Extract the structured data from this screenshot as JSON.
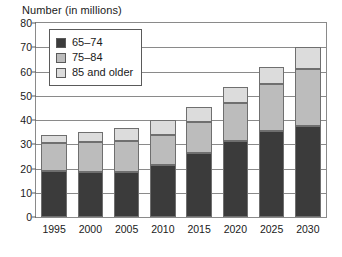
{
  "chart_data": {
    "type": "bar",
    "subtype": "stacked-bar",
    "title": "Number (in millions)",
    "xlabel": "",
    "ylabel": "",
    "categories": [
      "1995",
      "2000",
      "2005",
      "2010",
      "2015",
      "2020",
      "2025",
      "2030"
    ],
    "series": [
      {
        "name": "65–74",
        "color": "#3b3b3b",
        "values": [
          19.0,
          18.5,
          18.5,
          21.5,
          26.5,
          31.5,
          35.5,
          37.5
        ]
      },
      {
        "name": "75–84",
        "color": "#bcbcbc",
        "values": [
          11.5,
          12.5,
          13.0,
          12.5,
          12.5,
          15.5,
          19.5,
          23.5
        ]
      },
      {
        "name": "85 and older",
        "color": "#dcdcdc",
        "values": [
          3.5,
          4.0,
          5.0,
          6.0,
          6.5,
          6.5,
          7.0,
          9.0
        ]
      }
    ],
    "totals": [
      34.0,
      35.0,
      36.5,
      40.0,
      45.5,
      53.5,
      62.0,
      70.0
    ],
    "ylim": [
      0,
      80
    ],
    "ytick_step": 10,
    "yticks": [
      "80",
      "70",
      "60",
      "50",
      "40",
      "30",
      "20",
      "10",
      "0"
    ],
    "grid": true,
    "grid_axis": "y",
    "legend_position": "top-left-inside"
  },
  "legend": {
    "entries": [
      {
        "label": "65–74",
        "color": "#3b3b3b"
      },
      {
        "label": "75–84",
        "color": "#bcbcbc"
      },
      {
        "label": "85 and older",
        "color": "#dcdcdc"
      }
    ]
  }
}
